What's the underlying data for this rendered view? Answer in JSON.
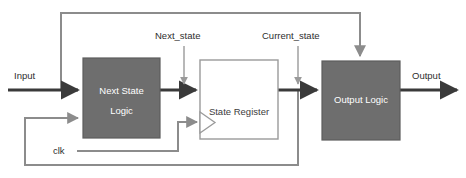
{
  "diagram": {
    "colors": {
      "block_fill": "#6e6e6e",
      "block_stroke": "#5d5d5d",
      "register_fill": "#ffffff",
      "register_stroke": "#9a9a9a",
      "signal_line": "#3a3a3a",
      "control_line": "#8c8c8c",
      "text_on_block": "#ffffff",
      "text_plain": "#2e2e2e",
      "background": "#ffffff"
    },
    "blocks": [
      {
        "id": "next-state-logic",
        "label_line1": "Next State",
        "label_line2": "Logic",
        "style": "filled"
      },
      {
        "id": "state-register",
        "label_line1": "State Register",
        "label_line2": "",
        "style": "outline"
      },
      {
        "id": "output-logic",
        "label_line1": "Output Logic",
        "label_line2": "",
        "style": "filled"
      }
    ],
    "signals": [
      {
        "id": "input",
        "label": "Input"
      },
      {
        "id": "next-state",
        "label": "Next_state"
      },
      {
        "id": "current-state",
        "label": "Current_state"
      },
      {
        "id": "output",
        "label": "Output"
      },
      {
        "id": "clk",
        "label": "clk"
      }
    ]
  }
}
